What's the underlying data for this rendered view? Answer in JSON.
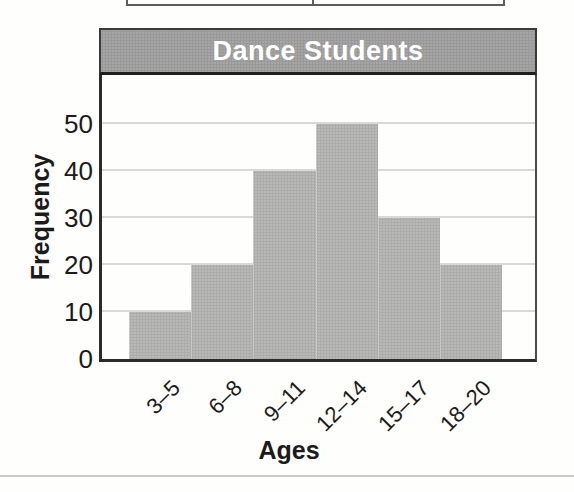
{
  "chart_data": {
    "type": "bar",
    "title": "Dance Students",
    "categories": [
      "3–5",
      "6–8",
      "9–11",
      "12–14",
      "15–17",
      "18–20"
    ],
    "values": [
      10,
      20,
      40,
      50,
      30,
      20
    ],
    "xlabel": "Ages",
    "ylabel": "Frequency",
    "yticks": [
      0,
      10,
      20,
      30,
      40,
      50
    ],
    "ylim": [
      0,
      60
    ],
    "grid": true,
    "legend": false,
    "bar_color": "#b9bab8",
    "banner_color": "#a6a6a6",
    "gridline_color": "#d9d9d9",
    "axis_color": "#2b2b2b"
  },
  "page": {
    "divider_color": "#c7c9c6",
    "table_fragment_line_color": "#5d5d5d"
  }
}
